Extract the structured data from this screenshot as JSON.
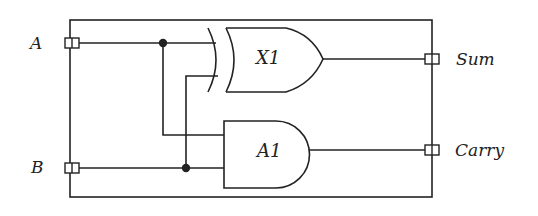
{
  "diagram": {
    "inputs": [
      {
        "label": "A",
        "y": 43
      },
      {
        "label": "B",
        "y": 168
      }
    ],
    "outputs": [
      {
        "label": "Sum",
        "y": 59
      },
      {
        "label": "Carry",
        "y": 150
      }
    ],
    "gates": [
      {
        "id": "X1",
        "type": "XOR",
        "label": "X1"
      },
      {
        "id": "A1",
        "type": "AND",
        "label": "A1"
      }
    ],
    "colors": {
      "line": "#222222",
      "background": "#ffffff"
    }
  }
}
